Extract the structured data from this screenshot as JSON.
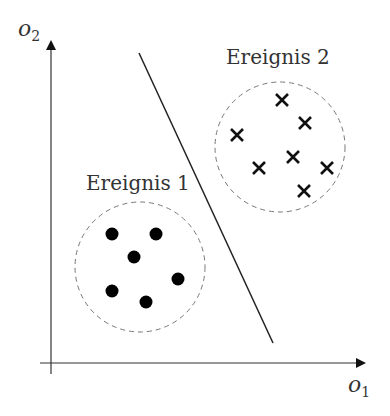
{
  "diagram": {
    "axes": {
      "x_label": "o",
      "x_sub": "1",
      "y_label": "o",
      "y_sub": "2"
    },
    "events": [
      {
        "label": "Ereignis 1",
        "marker": "dot",
        "center": [
          140,
          267
        ],
        "radius": 65,
        "points": [
          [
            112,
            234
          ],
          [
            156,
            234
          ],
          [
            134,
            257
          ],
          [
            178,
            279
          ],
          [
            112,
            291
          ],
          [
            146,
            302
          ]
        ]
      },
      {
        "label": "Ereignis 2",
        "marker": "cross",
        "center": [
          280,
          147
        ],
        "radius": 65,
        "points": [
          [
            282,
            100
          ],
          [
            305,
            123
          ],
          [
            237,
            135
          ],
          [
            293,
            157
          ],
          [
            259,
            168
          ],
          [
            327,
            168
          ],
          [
            304,
            191
          ]
        ]
      }
    ],
    "separator": {
      "from": [
        139,
        53
      ],
      "to": [
        273,
        343
      ]
    },
    "colors": {
      "ink": "#111111",
      "axis": "#333333",
      "dashed": "#777777"
    }
  }
}
